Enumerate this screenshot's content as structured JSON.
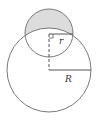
{
  "diagram": {
    "labels": {
      "small_radius": "r",
      "large_radius": "R"
    },
    "colors": {
      "stroke": "#7a7a7a",
      "shade": "#dcdcdc",
      "background": "#ffffff"
    },
    "shapes": {
      "small_circle": {
        "cx": 49,
        "cy": 33,
        "r": 24
      },
      "large_circle": {
        "cx": 49,
        "cy": 70,
        "r": 42
      }
    }
  }
}
